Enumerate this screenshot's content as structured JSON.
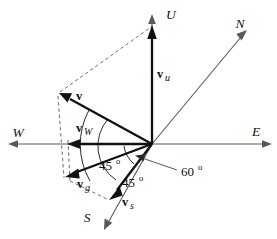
{
  "figure": {
    "type": "vector-decomposition-diagram",
    "background_color": "#ffffff",
    "axis_color": "#58585a",
    "vector_color": "#111111",
    "dashed_color": "#6d6d70",
    "origin": {
      "x": 152,
      "y": 144
    }
  },
  "axes": [
    {
      "name": "up-axis",
      "label": "U",
      "label_x": 166,
      "label_y": 19,
      "from": {
        "x": 152,
        "y": 144
      },
      "to": {
        "x": 152,
        "y": 14
      }
    },
    {
      "name": "north-axis",
      "label": "N",
      "label_x": 240,
      "label_y": 28,
      "from": {
        "x": 152,
        "y": 144
      },
      "to": {
        "x": 246,
        "y": 31
      }
    },
    {
      "name": "east-axis",
      "label": "E",
      "label_x": 256,
      "label_y": 136,
      "from": {
        "x": 152,
        "y": 144
      },
      "to": {
        "x": 272,
        "y": 144
      }
    },
    {
      "name": "west-axis",
      "label": "W",
      "label_x": 18,
      "label_y": 137,
      "from": {
        "x": 152,
        "y": 144
      },
      "to": {
        "x": 8,
        "y": 144
      }
    },
    {
      "name": "south-axis",
      "label": "S",
      "label_x": 87,
      "label_y": 222,
      "from": {
        "x": 152,
        "y": 144
      },
      "to": {
        "x": 104,
        "y": 230
      }
    }
  ],
  "vectors": [
    {
      "name": "velocity-vector",
      "label": "v",
      "subscript": "",
      "label_x": 76,
      "label_y": 100,
      "from": {
        "x": 152,
        "y": 144
      },
      "to": {
        "x": 60,
        "y": 94
      }
    },
    {
      "name": "up-component-vector",
      "label": "v",
      "subscript": "u",
      "label_x": 157,
      "label_y": 78,
      "from": {
        "x": 152,
        "y": 144
      },
      "to": {
        "x": 152,
        "y": 26
      }
    },
    {
      "name": "west-component-vector",
      "label": "v",
      "subscript": "W",
      "label_x": 76,
      "label_y": 132,
      "from": {
        "x": 152,
        "y": 144
      },
      "to": {
        "x": 68,
        "y": 144
      }
    },
    {
      "name": "ground-component-vector",
      "label": "v",
      "subscript": "g",
      "label_x": 77,
      "label_y": 188,
      "from": {
        "x": 152,
        "y": 144
      },
      "to": {
        "x": 66,
        "y": 176
      }
    },
    {
      "name": "south-component-vector",
      "label": "v",
      "subscript": "s",
      "label_x": 122,
      "label_y": 206,
      "from": {
        "x": 152,
        "y": 144
      },
      "to": {
        "x": 110,
        "y": 199
      }
    }
  ],
  "construction_lines": [
    {
      "name": "dashed-v-to-vu-tip",
      "from": {
        "x": 60,
        "y": 92
      },
      "to": {
        "x": 152,
        "y": 27
      }
    },
    {
      "name": "dashed-v-to-vg-tip",
      "from": {
        "x": 59,
        "y": 95
      },
      "to": {
        "x": 65,
        "y": 177
      }
    },
    {
      "name": "dashed-vw-to-vg-tip",
      "from": {
        "x": 68,
        "y": 141
      },
      "to": {
        "x": 67,
        "y": 180
      }
    },
    {
      "name": "dashed-vg-to-vs-tip",
      "from": {
        "x": 70,
        "y": 180
      },
      "to": {
        "x": 110,
        "y": 200
      }
    }
  ],
  "angles": [
    {
      "name": "angle-v-to-ground",
      "value": "45",
      "degree_symbol": "o",
      "label_x": 99,
      "label_y": 170,
      "arc": {
        "radius": 72,
        "start_deg": 151,
        "end_deg": 208
      }
    },
    {
      "name": "angle-vg-to-vs",
      "value": "45",
      "degree_symbol": "o",
      "label_x": 122,
      "label_y": 186,
      "arc": {
        "radius": 46,
        "start_deg": 160,
        "end_deg": 206
      }
    },
    {
      "name": "angle-vs-to-east",
      "value": "60",
      "degree_symbol": "o",
      "label_x": 181,
      "label_y": 176,
      "leader": {
        "from": {
          "x": 178,
          "y": 171
        },
        "to": {
          "x": 136,
          "y": 158
        }
      },
      "arc": {
        "radius": 30,
        "start_deg": 178,
        "end_deg": 232
      }
    }
  ]
}
